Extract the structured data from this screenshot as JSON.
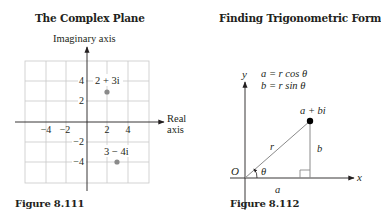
{
  "figure_left": {
    "title": "The Complex Plane",
    "caption": "Figure 8.111",
    "y_axis_label": "Imaginary axis",
    "x_axis_label_line1": "Real",
    "x_axis_label_line2": "axis",
    "x_ticks": [
      "−4",
      "−2",
      "2",
      "4"
    ],
    "y_ticks": [
      "4",
      "2",
      "−2",
      "−4"
    ],
    "points": [
      {
        "label": "2 + 3i",
        "re": 2,
        "im": 3
      },
      {
        "label": "3 − 4i",
        "re": 3,
        "im": -4
      }
    ],
    "point_color": "#8a8a8a",
    "grid_color": "#c8c8c8"
  },
  "figure_right": {
    "title": "Finding Trigonometric Form",
    "caption": "Figure 8.112",
    "y_axis_label": "y",
    "x_axis_label": "x",
    "origin_label": "O",
    "eq1": "a = r cos θ",
    "eq2": "b = r sin θ",
    "point_label": "a + bi",
    "r_label": "r",
    "b_label": "b",
    "a_label": "a",
    "angle_label": "θ",
    "point_color": "#000000",
    "line_color": "#8a8a8a"
  }
}
